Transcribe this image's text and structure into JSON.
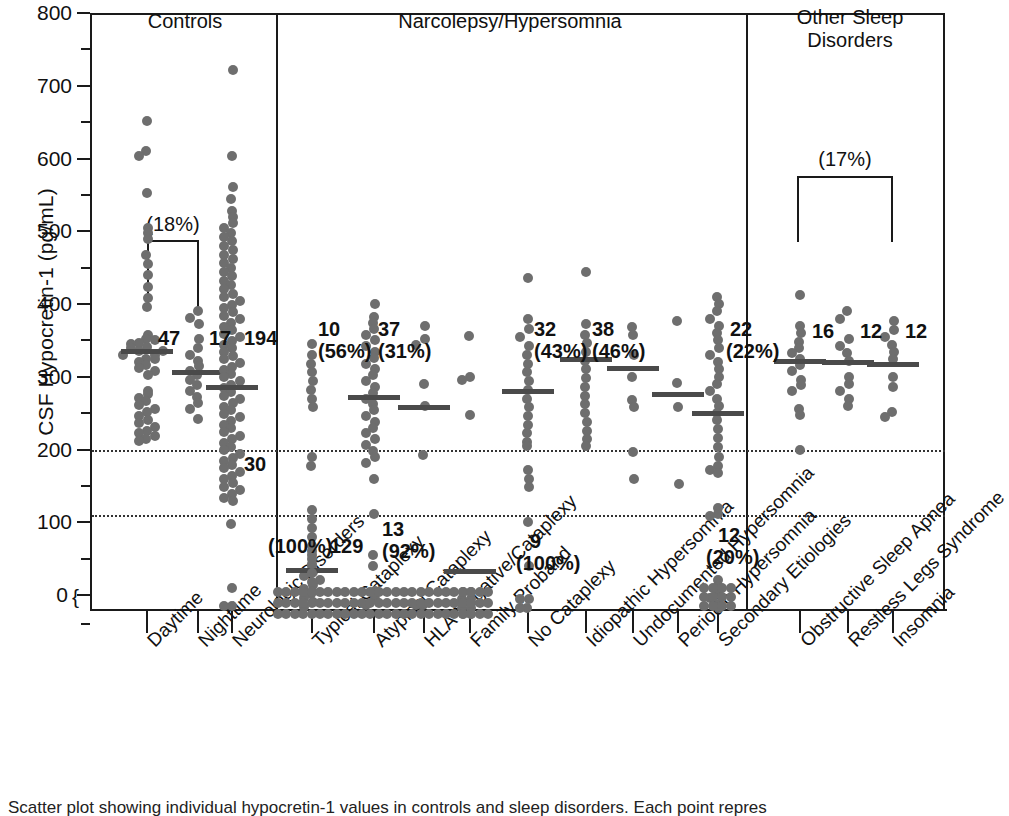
{
  "figure": {
    "caption": "Scatter plot showing individual hypocretin-1 values in controls and sleep disorders. Each point repres"
  },
  "axes": {
    "y_label": "CSF Hypocretin-1 (pg/mL)",
    "y_ticks": [
      0,
      100,
      200,
      300,
      400,
      500,
      600,
      700,
      800
    ],
    "y_tick_labels": [
      "0",
      "100",
      "200",
      "300",
      "400",
      "500",
      "600",
      "700",
      "800"
    ],
    "y_zero_brace": "{",
    "y_min": -40,
    "y_max": 800,
    "y_minor_step": 50,
    "threshold_lines": [
      200,
      110
    ]
  },
  "sections": [
    {
      "id": "controls",
      "title": "Controls"
    },
    {
      "id": "narcolepsy",
      "title": "Narcolepsy/Hypersomnia"
    },
    {
      "id": "other",
      "title": "Other Sleep\nDisorders"
    }
  ],
  "section_titles": {
    "controls": "Controls",
    "narcolepsy": "Narcolepsy/Hypersomnia",
    "other_line1": "Other Sleep",
    "other_line2": "Disorders"
  },
  "brackets": [
    {
      "id": "controls-bracket",
      "label": "(18%)"
    },
    {
      "id": "other-bracket",
      "label": "(17%)"
    }
  ],
  "colors": {
    "dot": "#6e6e6e",
    "axis": "#1a1a1a",
    "mean_bar": "#4a4a4a",
    "threshold": "#333333",
    "background": "#ffffff"
  },
  "chart_data": {
    "type": "scatter",
    "title": "",
    "xlabel": "",
    "ylabel": "CSF Hypocretin-1 (pg/mL)",
    "ylim": [
      -40,
      800
    ],
    "grid": false,
    "legend": "none",
    "threshold_lines": [
      200,
      110
    ],
    "groups": [
      {
        "name": "Daytime",
        "section": "Controls",
        "n_label": "47",
        "pct_label": "",
        "mean": 335,
        "values": [
          652,
          610,
          603,
          553,
          505,
          497,
          490,
          468,
          455,
          440,
          424,
          408,
          396,
          358,
          352,
          347,
          341,
          336,
          330,
          325,
          320,
          316,
          312,
          308,
          303,
          281,
          276,
          271,
          266,
          261,
          256,
          251,
          246,
          241,
          236,
          231,
          226,
          222,
          218,
          215,
          212,
          350,
          345,
          340,
          335,
          330,
          325
        ]
      },
      {
        "name": "Nighttime",
        "section": "Controls",
        "n_label": "17",
        "pct_label": "",
        "mean": 306,
        "values": [
          390,
          381,
          372,
          352,
          340,
          330,
          322,
          315,
          308,
          302,
          296,
          288,
          280,
          272,
          264,
          255,
          242
        ]
      },
      {
        "name": "Neurologic Disorders",
        "section": "Controls",
        "n_label": "194",
        "pct_label": "",
        "secondary_label": "30",
        "mean": 286,
        "values": [
          722,
          603,
          561,
          545,
          528,
          520,
          512,
          505,
          498,
          492,
          486,
          480,
          474,
          468,
          462,
          456,
          450,
          444,
          438,
          432,
          426,
          420,
          414,
          409,
          404,
          399,
          394,
          389,
          384,
          379,
          374,
          369,
          364,
          359,
          354,
          349,
          344,
          339,
          334,
          329,
          324,
          319,
          314,
          309,
          304,
          299,
          294,
          289,
          284,
          279,
          274,
          269,
          264,
          259,
          254,
          249,
          244,
          239,
          234,
          229,
          224,
          219,
          214,
          209,
          204,
          199,
          194,
          189,
          184,
          179,
          174,
          169,
          164,
          159,
          154,
          149,
          144,
          139,
          134,
          129,
          98,
          10,
          -15,
          -15
        ]
      },
      {
        "name": "Typical Cataplexy",
        "section": "Narcolepsy/Hypersomnia",
        "n_label_top": "10",
        "pct_label_top": "(56%)",
        "n_label_bottom": "129",
        "pct_label_bottom": "(100%)",
        "mean": 35,
        "values": [
          345,
          330,
          318,
          306,
          294,
          282,
          270,
          258,
          190,
          178,
          60,
          50,
          40,
          32,
          26,
          20,
          14,
          8,
          2,
          -4,
          -10,
          -16
        ]
      },
      {
        "name": "Atypical Cataplexy",
        "section": "Narcolepsy/Hypersomnia",
        "n_label_top": "37",
        "pct_label_top": "(31%)",
        "n_label_bottom": "13",
        "pct_label_bottom": "(92%)",
        "mean": 272,
        "values": [
          400,
          382,
          374,
          366,
          358,
          350,
          342,
          334,
          326,
          318,
          310,
          302,
          294,
          286,
          278,
          270,
          262,
          254,
          246,
          238,
          230,
          222,
          214,
          206,
          198,
          190,
          182,
          160,
          112,
          55,
          40,
          5,
          -6,
          -14
        ]
      },
      {
        "name": "HLA Negative/Cataplexy",
        "section": "Narcolepsy/Hypersomnia",
        "n_label": "",
        "pct_label": "",
        "mean": 258,
        "values": [
          370,
          352,
          344,
          290,
          260,
          192,
          -14,
          -14
        ]
      },
      {
        "name": "Family Proband",
        "section": "Narcolepsy/Hypersomnia",
        "n_label": "",
        "pct_label": "",
        "mean": 33,
        "values": [
          356,
          300,
          296,
          248,
          -6,
          -6,
          -18,
          -18
        ]
      },
      {
        "name": "No Cataplexy",
        "section": "Narcolepsy/Hypersomnia",
        "n_label_top": "32",
        "pct_label_top": "(43%)",
        "n_label_bottom": "9",
        "pct_label_bottom": "(100%)",
        "mean": 281,
        "values": [
          436,
          380,
          366,
          354,
          342,
          330,
          318,
          306,
          294,
          282,
          270,
          258,
          246,
          234,
          222,
          210,
          205,
          172,
          160,
          148,
          100,
          40,
          -6,
          -6,
          -18,
          -18
        ]
      },
      {
        "name": "Idiopathic Hypersomnia",
        "section": "Narcolepsy/Hypersomnia",
        "n_label": "38",
        "pct_label": "(46%)",
        "mean": 325,
        "values": [
          444,
          372,
          358,
          346,
          334,
          322,
          310,
          298,
          286,
          274,
          262,
          250,
          238,
          226,
          214,
          205
        ]
      },
      {
        "name": "Undocumented Hypersomnia",
        "section": "Narcolepsy/Hypersomnia",
        "n_label": "",
        "pct_label": "",
        "mean": 312,
        "values": [
          368,
          358,
          330,
          300,
          268,
          258,
          196,
          160
        ]
      },
      {
        "name": "Periodic Hypersomnia",
        "section": "Narcolepsy/Hypersomnia",
        "n_label": "",
        "pct_label": "",
        "mean": 276,
        "values": [
          376,
          292,
          258,
          152
        ]
      },
      {
        "name": "Secondary Etiologies",
        "section": "Narcolepsy/Hypersomnia",
        "n_label_top": "22",
        "pct_label_top": "(22%)",
        "n_label_bottom": "12",
        "pct_label_bottom": "(20%)",
        "mean": 250,
        "values": [
          410,
          400,
          390,
          380,
          370,
          360,
          350,
          340,
          330,
          320,
          310,
          300,
          290,
          280,
          270,
          260,
          250,
          240,
          228,
          216,
          204,
          190,
          178,
          172,
          168,
          120,
          112,
          108,
          20,
          12,
          4,
          -4,
          -12,
          -18
        ]
      },
      {
        "name": "Obstructive Sleep Apnea",
        "section": "Other Sleep Disorders",
        "n_label": "16",
        "pct_label": "",
        "mean": 322,
        "values": [
          412,
          370,
          360,
          348,
          340,
          332,
          324,
          316,
          308,
          296,
          288,
          280,
          256,
          248,
          200
        ]
      },
      {
        "name": "Restless Legs Syndrome",
        "section": "Other Sleep Disorders",
        "n_label": "12",
        "pct_label": "",
        "mean": 320,
        "values": [
          390,
          380,
          352,
          342,
          332,
          322,
          300,
          290,
          280,
          270,
          260
        ]
      },
      {
        "name": "Insomnia",
        "section": "Other Sleep Disorders",
        "n_label": "12",
        "pct_label": "",
        "mean": 318,
        "values": [
          376,
          364,
          354,
          344,
          334,
          324,
          300,
          286,
          252,
          244
        ]
      }
    ]
  }
}
